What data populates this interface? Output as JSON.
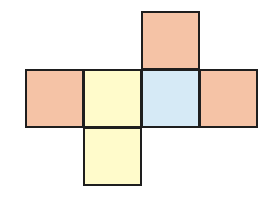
{
  "diagram": {
    "type": "cube-net",
    "cell_size": 59,
    "origin": {
      "x": 25,
      "y": 11
    },
    "border_color": "#1e1e1e",
    "colors": {
      "orange": "#f5c3a6",
      "yellow": "#fffbcb",
      "blue": "#d6eaf6"
    },
    "faces": [
      {
        "id": "top",
        "col": 2,
        "row": 0,
        "color": "orange"
      },
      {
        "id": "left",
        "col": 0,
        "row": 1,
        "color": "orange"
      },
      {
        "id": "center-left",
        "col": 1,
        "row": 1,
        "color": "yellow"
      },
      {
        "id": "center-right",
        "col": 2,
        "row": 1,
        "color": "blue"
      },
      {
        "id": "right",
        "col": 3,
        "row": 1,
        "color": "orange"
      },
      {
        "id": "bottom",
        "col": 1,
        "row": 2,
        "color": "yellow"
      }
    ]
  }
}
